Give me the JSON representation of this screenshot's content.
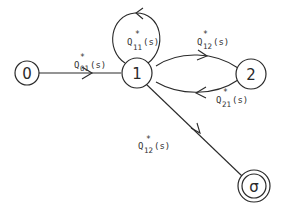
{
  "diagram": {
    "type": "state-transition-graph",
    "nodes": [
      {
        "id": "0",
        "label": "0"
      },
      {
        "id": "1",
        "label": "1"
      },
      {
        "id": "2",
        "label": "2"
      },
      {
        "id": "sigma",
        "label": "σ"
      }
    ],
    "edges": [
      {
        "from": "0",
        "to": "1",
        "label": {
          "base": "Q",
          "star": "*",
          "sub": "01",
          "arg": "(s)"
        }
      },
      {
        "from": "1",
        "to": "1",
        "label": {
          "base": "Q",
          "star": "*",
          "sub": "11",
          "arg": "(s)"
        }
      },
      {
        "from": "1",
        "to": "2",
        "label": {
          "base": "Q",
          "star": "*",
          "sub": "12",
          "arg": "(s)"
        }
      },
      {
        "from": "2",
        "to": "1",
        "label": {
          "base": "Q",
          "star": "*",
          "sub": "21",
          "arg": "(s)"
        }
      },
      {
        "from": "1",
        "to": "sigma",
        "label": {
          "base": "Q",
          "star": "*",
          "sub": "12",
          "arg": "(s)"
        }
      }
    ]
  }
}
